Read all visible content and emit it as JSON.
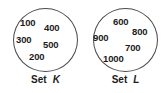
{
  "diagram": {
    "type": "set-diagram",
    "background_color": "#ffffff",
    "outline_color": "#4a4a4a",
    "text_color": "#1c1c1c",
    "sets": [
      {
        "id": "set-k",
        "name_word": "Set",
        "name_letter": "K",
        "full_label": "Set K",
        "elements": [
          "100",
          "400",
          "300",
          "500",
          "200"
        ]
      },
      {
        "id": "set-l",
        "name_word": "Set",
        "name_letter": "L",
        "full_label": "Set L",
        "elements": [
          "600",
          "800",
          "900",
          "700",
          "1000"
        ]
      }
    ]
  }
}
